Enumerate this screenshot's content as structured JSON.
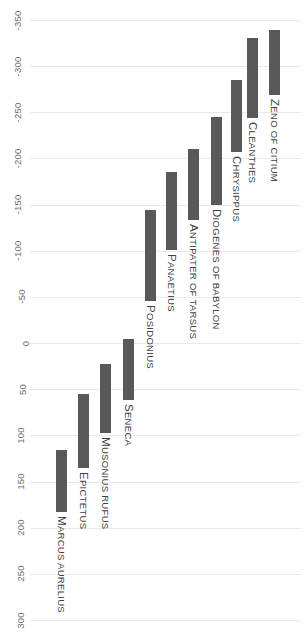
{
  "chart_data": {
    "type": "bar",
    "orientation": "vertical-gantt",
    "title": "",
    "subtitle": "",
    "xlabel": "",
    "ylabel": "",
    "ylim": [
      -350,
      300
    ],
    "y_inverted": true,
    "grid": true,
    "legend": "none",
    "bar_color": "#595959",
    "gridline_color": "#e9e9e9",
    "background_color": "#ffffff",
    "axis_label_color": "#6d6d6d",
    "yticks": [
      -350,
      -300,
      -250,
      -200,
      -150,
      -100,
      -50,
      0,
      50,
      100,
      150,
      200,
      250,
      300
    ],
    "ytick_labels": [
      "-350",
      "-300",
      "-250",
      "-200",
      "-150",
      "-100",
      "-50",
      "0",
      "50",
      "100",
      "150",
      "200",
      "250",
      "300"
    ],
    "categories": [
      "MARCUS AURELIUS",
      "EPICTETUS",
      "MUSONIUS RUFUS",
      "SENECA",
      "POSIDONIUS",
      "PANAETIUS",
      "ANTIPATER OF TARSUS",
      "DIOGENES OF BABYLON",
      "CHRYSIPPUS",
      "CLEANTHES",
      "ZENO OF CITIUM"
    ],
    "bars": [
      {
        "label": "MARCUS AURELIUS",
        "start": 116,
        "end": 183,
        "x": 56,
        "top": 448,
        "bottom": 510
      },
      {
        "label": "EPICTETUS",
        "start": 55,
        "end": 135,
        "x": 78,
        "top": 392,
        "bottom": 465
      },
      {
        "label": "MUSONIUS RUFUS",
        "start": 23,
        "end": 97,
        "x": 100,
        "top": 362,
        "bottom": 430
      },
      {
        "label": "SENECA",
        "start": -4,
        "end": 62,
        "x": 123,
        "top": 337,
        "bottom": 398
      },
      {
        "label": "POSIDONIUS",
        "start": -144,
        "end": -46,
        "x": 145,
        "top": 210,
        "bottom": 300
      },
      {
        "label": "PANAETIUS",
        "start": -185,
        "end": -101,
        "x": 166,
        "top": 172,
        "bottom": 249
      },
      {
        "label": "ANTIPATER OF TARSUS",
        "start": -210,
        "end": -133,
        "x": 188,
        "top": 149,
        "bottom": 220
      },
      {
        "label": "DIOGENES OF BABYLON",
        "start": -245,
        "end": -150,
        "x": 211,
        "top": 117,
        "bottom": 205
      },
      {
        "label": "CHRYSIPPUS",
        "start": -285,
        "end": -207,
        "x": 231,
        "top": 80,
        "bottom": 152
      },
      {
        "label": "CLEANTHES",
        "start": -331,
        "end": -244,
        "x": 247,
        "top": 38,
        "bottom": 118
      },
      {
        "label": "ZENO OF CITIUM",
        "start": -339,
        "end": -269,
        "x": 269,
        "top": 30,
        "bottom": 95
      }
    ]
  }
}
